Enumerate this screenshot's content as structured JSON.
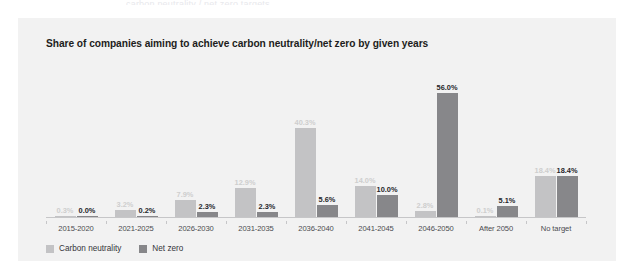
{
  "top_sliver_text": "carbon neutrality / net zero targets",
  "card": {
    "title": "Share of companies aiming to achieve carbon neutrality/net zero by given years",
    "background_color": "#f2f2f2"
  },
  "legend": {
    "position": "bottom-left",
    "items": [
      {
        "label": "Carbon neutrality",
        "color": "#c3c3c5",
        "swatch": "light"
      },
      {
        "label": "Net zero",
        "color": "#87878a",
        "swatch": "dark"
      }
    ]
  },
  "chart_data": {
    "type": "bar",
    "title": "Share of companies aiming to achieve carbon neutrality/net zero by given years",
    "xlabel": "",
    "ylabel": "",
    "ylim": [
      0,
      60
    ],
    "grid": false,
    "legend_position": "bottom-left",
    "categories": [
      "2015-2020",
      "2021-2025",
      "2026-2030",
      "2031-2035",
      "2036-2040",
      "2041-2045",
      "2046-2050",
      "After 2050",
      "No target"
    ],
    "series": [
      {
        "name": "Carbon neutrality",
        "color": "#c3c3c5",
        "values": [
          0.3,
          3.2,
          7.9,
          12.9,
          40.3,
          14.0,
          2.8,
          0.1,
          18.4
        ],
        "labels": [
          "0.3%",
          "3.2%",
          "7.9%",
          "12.9%",
          "40.3%",
          "14.0%",
          "2.8%",
          "0.1%",
          "18.4%"
        ]
      },
      {
        "name": "Net zero",
        "color": "#87878a",
        "values": [
          0.0,
          0.2,
          2.3,
          2.3,
          5.6,
          10.0,
          56.0,
          5.1,
          18.4
        ],
        "labels": [
          "0.0%",
          "0.2%",
          "2.3%",
          "2.3%",
          "5.6%",
          "10.0%",
          "56.0%",
          "5.1%",
          "18.4%"
        ]
      }
    ]
  }
}
